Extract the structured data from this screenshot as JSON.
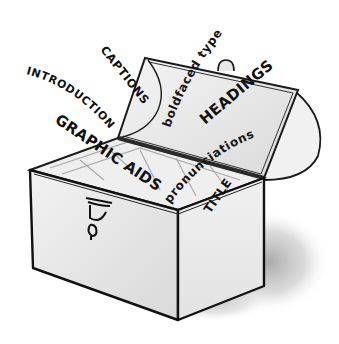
{
  "illustration": {
    "subject": "open toolbox / chest with text features flying out",
    "labels": {
      "introduction": "INTRODUCTION",
      "captions": "CAPTIONS",
      "boldfaced_type": "boldfaced type",
      "headings": "HEADINGS",
      "pronunciations": "pronunciations",
      "graphic_aids": "GRAPHIC AIDS",
      "title": "TITLE"
    },
    "colors": {
      "ink": "#111111",
      "box_face": "#ececec",
      "box_face_shade": "#d8d8d8",
      "lid_inner": "#e6e6e6",
      "shadow": "#bdbdbd",
      "background": "#ffffff"
    }
  }
}
